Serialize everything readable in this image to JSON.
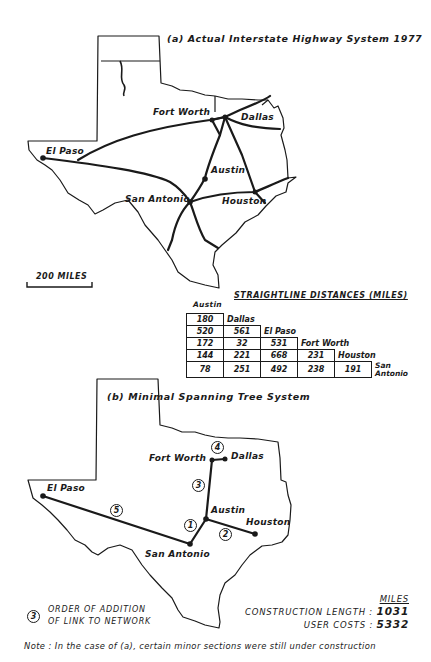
{
  "map_a": {
    "title": "(a) Actual Interstate Highway System 1977",
    "cities": {
      "el_paso": "El Paso",
      "fort_worth": "Fort Worth",
      "dallas": "Dallas",
      "austin": "Austin",
      "san_antonio": "San Antonio",
      "houston": "Houston"
    },
    "scale_label": "200 MILES"
  },
  "distances": {
    "title": "STRAIGHTLINE DISTANCES (MILES)",
    "header_austin": "Austin",
    "rows": [
      {
        "values": [
          "180"
        ],
        "label": "Dallas"
      },
      {
        "values": [
          "520",
          "561"
        ],
        "label": "El Paso"
      },
      {
        "values": [
          "172",
          "32",
          "531"
        ],
        "label": "Fort Worth"
      },
      {
        "values": [
          "144",
          "221",
          "668",
          "231"
        ],
        "label": "Houston"
      },
      {
        "values": [
          "78",
          "251",
          "492",
          "238",
          "191"
        ],
        "label": "San Antonio"
      }
    ]
  },
  "map_b": {
    "title": "(b) Minimal Spanning Tree System",
    "cities": {
      "el_paso": "El Paso",
      "fort_worth": "Fort Worth",
      "dallas": "Dallas",
      "austin": "Austin",
      "san_antonio": "San Antonio",
      "houston": "Houston"
    },
    "link_orders": [
      "1",
      "2",
      "3",
      "4",
      "5"
    ]
  },
  "legend": {
    "symbol": "3",
    "line1": "ORDER OF ADDITION",
    "line2": "OF LINK TO NETWORK"
  },
  "stats": {
    "unit": "MILES",
    "construction_label": "CONSTRUCTION LENGTH :",
    "construction_value": "1031",
    "user_costs_label": "USER COSTS :",
    "user_costs_value": "5332"
  },
  "note": "Note : In the case of (a), certain minor sections were still under construction"
}
